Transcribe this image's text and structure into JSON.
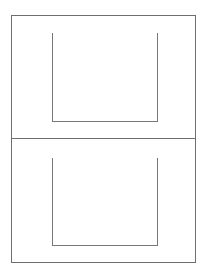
{
  "diagram": {
    "type": "two-panel layout with U-shaped brackets",
    "panels": [
      {
        "id": "top",
        "shape": "U-bracket"
      },
      {
        "id": "bottom",
        "shape": "U-bracket"
      }
    ],
    "colors": {
      "line": "#6e6e6e",
      "background": "#ffffff"
    }
  }
}
